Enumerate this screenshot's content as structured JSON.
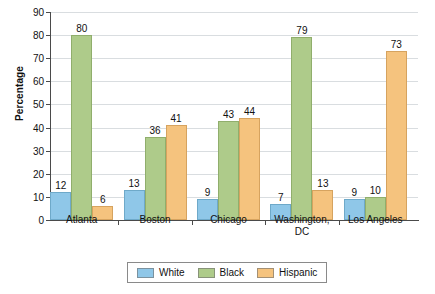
{
  "chart_data": {
    "type": "bar",
    "title": "",
    "xlabel": "",
    "ylabel": "Percentage",
    "ylim": [
      0,
      90
    ],
    "y_ticks": [
      0,
      10,
      20,
      30,
      40,
      50,
      60,
      70,
      80,
      90
    ],
    "grid": true,
    "legend_position": "bottom",
    "categories": [
      "Atlanta",
      "Boston",
      "Chicago",
      "Washington,\nDC",
      "Los Angeles"
    ],
    "series": [
      {
        "name": "White",
        "color": "#8fc7e8",
        "values": [
          12,
          13,
          9,
          7,
          9
        ]
      },
      {
        "name": "Black",
        "color": "#aecb8a",
        "values": [
          80,
          36,
          43,
          79,
          10
        ]
      },
      {
        "name": "Hispanic",
        "color": "#f5c37e",
        "values": [
          6,
          41,
          44,
          13,
          73
        ]
      }
    ]
  },
  "axis": {
    "y_title": "Percentage"
  },
  "legend": {
    "items": [
      {
        "label": "White"
      },
      {
        "label": "Black"
      },
      {
        "label": "Hispanic"
      }
    ]
  }
}
